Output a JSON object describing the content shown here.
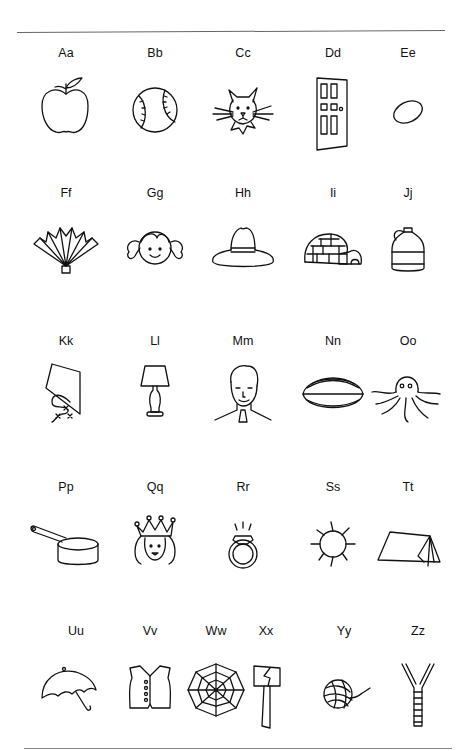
{
  "worksheet": {
    "rows": [
      [
        {
          "letter": "Aa",
          "picture": "apple"
        },
        {
          "letter": "Bb",
          "picture": "baseball"
        },
        {
          "letter": "Cc",
          "picture": "cat"
        },
        {
          "letter": "Dd",
          "picture": "door"
        },
        {
          "letter": "Ee",
          "picture": "egg"
        }
      ],
      [
        {
          "letter": "Ff",
          "picture": "fan"
        },
        {
          "letter": "Gg",
          "picture": "girl"
        },
        {
          "letter": "Hh",
          "picture": "hat"
        },
        {
          "letter": "Ii",
          "picture": "igloo"
        },
        {
          "letter": "Jj",
          "picture": "jug"
        }
      ],
      [
        {
          "letter": "Kk",
          "picture": "kite"
        },
        {
          "letter": "Ll",
          "picture": "lamp"
        },
        {
          "letter": "Mm",
          "picture": "man"
        },
        {
          "letter": "Nn",
          "picture": "nut"
        },
        {
          "letter": "Oo",
          "picture": "octopus"
        }
      ],
      [
        {
          "letter": "Pp",
          "picture": "pan"
        },
        {
          "letter": "Qq",
          "picture": "queen"
        },
        {
          "letter": "Rr",
          "picture": "ring"
        },
        {
          "letter": "Ss",
          "picture": "sun"
        },
        {
          "letter": "Tt",
          "picture": "tent"
        }
      ],
      [
        {
          "letter": "Uu",
          "picture": "umbrella"
        },
        {
          "letter": "Vv",
          "picture": "vest"
        },
        {
          "letter": "Ww",
          "picture": "web"
        },
        {
          "letter": "Xx",
          "picture": "ax"
        },
        {
          "letter": "Yy",
          "picture": "yarn"
        },
        {
          "letter": "Zz",
          "picture": "zipper"
        }
      ]
    ]
  }
}
